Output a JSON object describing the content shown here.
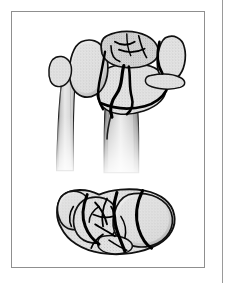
{
  "figure": {
    "title": "Comminuted distal femur fracture",
    "caption": "",
    "frame": {
      "border_color": "#8f8f8f",
      "background": "#ffffff"
    },
    "column_rule_color": "#9a9a9a",
    "colors": {
      "bone_fill_light": "#e2e2e2",
      "bone_fill_mid": "#cfcfcf",
      "bone_fill_shadow": "#b0b0b0",
      "outline": "#111111",
      "fracture_line": "#000000",
      "stipple": "#8a8a8a",
      "page_background": "#ffffff"
    },
    "views": [
      {
        "name": "anteroposterior-view",
        "label": "Anteroposterior view",
        "description": "Distal femur with comminuted intra-articular fracture; two shaft columns fading distally",
        "fragments": [
          "medial-condyle-fragment",
          "lateral-condyle-fragment",
          "intercondylar-fragment",
          "displaced-lateral-fragment",
          "metaphyseal-wedge-fragment"
        ]
      },
      {
        "name": "axial-view",
        "label": "Axial cross-section view",
        "description": "Cross-section through the condyles showing multiple radiating fracture lines",
        "fragments": [
          "medial-condyle-section",
          "lateral-condyle-section",
          "intercondylar-comminution",
          "posterior-fragment"
        ]
      }
    ]
  }
}
